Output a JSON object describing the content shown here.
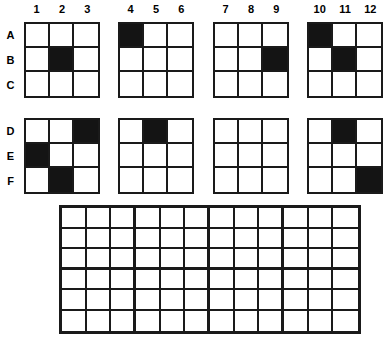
{
  "worksheet": {
    "title": "Grid pattern worksheet",
    "column_labels": [
      "1",
      "2",
      "3",
      "4",
      "5",
      "6",
      "7",
      "8",
      "9",
      "10",
      "11",
      "12"
    ],
    "row_labels_top": [
      "A",
      "B",
      "C"
    ],
    "row_labels_bottom": [
      "D",
      "E",
      "F"
    ],
    "fill_color": "#141414",
    "line_color": "#1a1a1a",
    "background_color": "#ffffff"
  },
  "grids_top": [
    {
      "name": "grid-1",
      "columns": [
        "1",
        "2",
        "3"
      ],
      "rows": [
        "A",
        "B",
        "C"
      ],
      "filled_cells": [
        "B2"
      ],
      "pattern": [
        [
          0,
          0,
          0
        ],
        [
          0,
          1,
          0
        ],
        [
          0,
          0,
          0
        ]
      ]
    },
    {
      "name": "grid-2",
      "columns": [
        "4",
        "5",
        "6"
      ],
      "rows": [
        "A",
        "B",
        "C"
      ],
      "filled_cells": [
        "A4"
      ],
      "pattern": [
        [
          1,
          0,
          0
        ],
        [
          0,
          0,
          0
        ],
        [
          0,
          0,
          0
        ]
      ]
    },
    {
      "name": "grid-3",
      "columns": [
        "7",
        "8",
        "9"
      ],
      "rows": [
        "A",
        "B",
        "C"
      ],
      "filled_cells": [
        "B9"
      ],
      "pattern": [
        [
          0,
          0,
          0
        ],
        [
          0,
          0,
          1
        ],
        [
          0,
          0,
          0
        ]
      ]
    },
    {
      "name": "grid-4",
      "columns": [
        "10",
        "11",
        "12"
      ],
      "rows": [
        "A",
        "B",
        "C"
      ],
      "filled_cells": [
        "A10",
        "B11"
      ],
      "pattern": [
        [
          1,
          0,
          0
        ],
        [
          0,
          1,
          0
        ],
        [
          0,
          0,
          0
        ]
      ]
    }
  ],
  "grids_bottom": [
    {
      "name": "grid-5",
      "columns": [
        "1",
        "2",
        "3"
      ],
      "rows": [
        "D",
        "E",
        "F"
      ],
      "filled_cells": [
        "D3",
        "E1",
        "F2"
      ],
      "pattern": [
        [
          0,
          0,
          1
        ],
        [
          1,
          0,
          0
        ],
        [
          0,
          1,
          0
        ]
      ]
    },
    {
      "name": "grid-6",
      "columns": [
        "4",
        "5",
        "6"
      ],
      "rows": [
        "D",
        "E",
        "F"
      ],
      "filled_cells": [
        "D5"
      ],
      "pattern": [
        [
          0,
          1,
          0
        ],
        [
          0,
          0,
          0
        ],
        [
          0,
          0,
          0
        ]
      ]
    },
    {
      "name": "grid-7",
      "columns": [
        "7",
        "8",
        "9"
      ],
      "rows": [
        "D",
        "E",
        "F"
      ],
      "filled_cells": [],
      "pattern": [
        [
          0,
          0,
          0
        ],
        [
          0,
          0,
          0
        ],
        [
          0,
          0,
          0
        ]
      ]
    },
    {
      "name": "grid-8",
      "columns": [
        "10",
        "11",
        "12"
      ],
      "rows": [
        "D",
        "E",
        "F"
      ],
      "filled_cells": [
        "D11",
        "F12"
      ],
      "pattern": [
        [
          0,
          1,
          0
        ],
        [
          0,
          0,
          0
        ],
        [
          0,
          0,
          1
        ]
      ]
    }
  ],
  "answer_grid": {
    "name": "answer-grid",
    "columns": 12,
    "rows": 6,
    "block_columns": 3,
    "block_rows": 3,
    "filled_cells": [],
    "empty": true
  }
}
